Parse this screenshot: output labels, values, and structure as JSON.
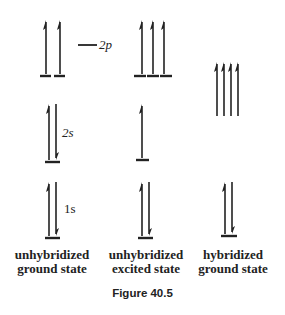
{
  "figure": {
    "caption": "Figure 40.5",
    "orbital_labels": {
      "p2": "2p",
      "s2": "2s",
      "s1": "1s"
    },
    "columns": [
      {
        "label_line1": "unhybridized",
        "label_line2": "ground state",
        "levels": [
          {
            "orbital": "2p",
            "electrons": [
              "up",
              "up"
            ],
            "slots": 3
          },
          {
            "orbital": "2s",
            "electrons": [
              "up",
              "down"
            ]
          },
          {
            "orbital": "1s",
            "electrons": [
              "up",
              "down"
            ]
          }
        ]
      },
      {
        "label_line1": "unhybridized",
        "label_line2": "excited state",
        "levels": [
          {
            "orbital": "2p",
            "electrons": [
              "up",
              "up",
              "up"
            ]
          },
          {
            "orbital": "2s",
            "electrons": [
              "up"
            ]
          },
          {
            "orbital": "1s",
            "electrons": [
              "up",
              "down"
            ]
          }
        ]
      },
      {
        "label_line1": "hybridized",
        "label_line2": "ground state",
        "levels": [
          {
            "orbital": "sp3",
            "electrons": [
              "up",
              "up",
              "up",
              "up"
            ]
          },
          {
            "orbital": "1s",
            "electrons": [
              "up",
              "down"
            ]
          }
        ]
      }
    ],
    "colors": {
      "ink": "#222222",
      "background": "#ffffff"
    }
  }
}
